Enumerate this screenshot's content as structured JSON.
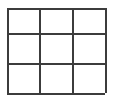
{
  "image": {
    "width": 113,
    "height": 101,
    "background_color": "#ffffff",
    "description": "3 by 3 grid"
  },
  "grid": {
    "name": "three-by-three-grid",
    "rows": 3,
    "columns": 3,
    "line_color": "#3c3c3c",
    "line_thickness_px": 2,
    "bounds": {
      "left": 7,
      "top": 8,
      "right": 105,
      "bottom": 93,
      "width": 98,
      "height": 85
    },
    "vertical_line_positions": [
      7,
      39,
      72,
      105
    ],
    "horizontal_line_positions": [
      8,
      33,
      63,
      93
    ],
    "column_widths": [
      32,
      33,
      33
    ],
    "row_heights": [
      25,
      30,
      30
    ],
    "cells": [
      {
        "id": "cell-r1c1",
        "row": 1,
        "column": 1,
        "label": ""
      },
      {
        "id": "cell-r1c2",
        "row": 1,
        "column": 2,
        "label": ""
      },
      {
        "id": "cell-r1c3",
        "row": 1,
        "column": 3,
        "label": ""
      },
      {
        "id": "cell-r2c1",
        "row": 2,
        "column": 1,
        "label": ""
      },
      {
        "id": "cell-r2c2",
        "row": 2,
        "column": 2,
        "label": ""
      },
      {
        "id": "cell-r2c3",
        "row": 2,
        "column": 3,
        "label": ""
      },
      {
        "id": "cell-r3c1",
        "row": 3,
        "column": 1,
        "label": ""
      },
      {
        "id": "cell-r3c2",
        "row": 3,
        "column": 2,
        "label": ""
      },
      {
        "id": "cell-r3c3",
        "row": 3,
        "column": 3,
        "label": ""
      }
    ]
  }
}
